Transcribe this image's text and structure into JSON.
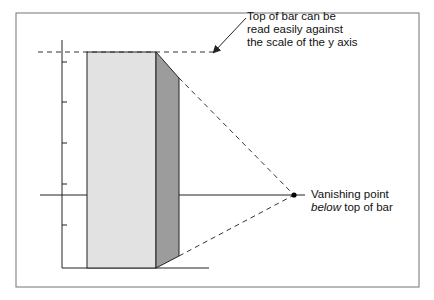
{
  "diagram": {
    "title": "",
    "frame": {
      "x": 16,
      "y": 13,
      "w": 403,
      "h": 274,
      "stroke": "#8a8a8a"
    },
    "colors": {
      "bar_front": "#e2e2e2",
      "bar_side": "#9c9c9c",
      "line": "#222222",
      "dashed": "#333333",
      "text": "#111111"
    },
    "y_axis": {
      "x": 62,
      "y_top": 40,
      "y_bottom": 268,
      "ticks_y": [
        62,
        102,
        143,
        184,
        225
      ]
    },
    "baseline": {
      "y": 268,
      "x_start": 62,
      "x_end": 209
    },
    "bar": {
      "front": {
        "x": 87,
        "y_top": 52,
        "y_bottom": 268,
        "width": 69
      },
      "side": {
        "x_left": 156,
        "x_right": 179,
        "top_left_y": 52,
        "top_right_y": 78,
        "bottom_left_y": 268,
        "bottom_right_y": 256
      }
    },
    "horizon_line": {
      "y": 195,
      "x_start": 40,
      "x_end": 305
    },
    "vanishing_point": {
      "x": 294,
      "y": 195
    },
    "top_reference_line": {
      "y": 52,
      "x_start": 38,
      "x_end": 214
    },
    "annotations": {
      "top_of_bar": {
        "lines": [
          "Top of bar can be",
          "read easily against",
          "the scale of the y axis"
        ],
        "arrow": {
          "from_x": 246,
          "from_y": 18,
          "to_x": 214,
          "to_y": 52
        }
      },
      "vanishing_point": {
        "line1": "Vanishing point",
        "line2_italic": "below",
        "line2_rest": " top of bar"
      }
    }
  }
}
